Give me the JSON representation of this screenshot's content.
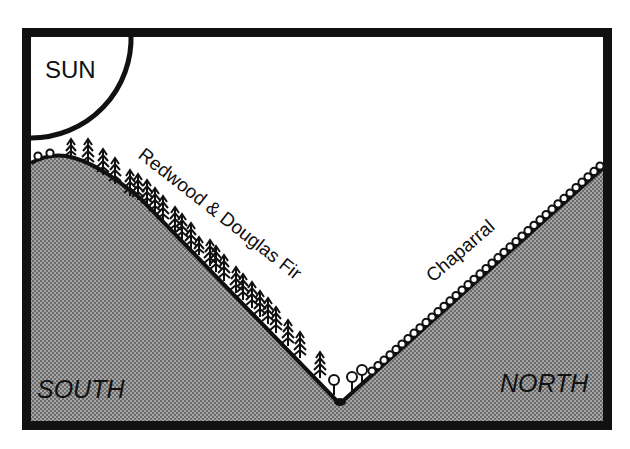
{
  "diagram": {
    "labels": {
      "sun": "SUN",
      "south_vegetation": "Redwood & Douglas Fir",
      "north_vegetation": "Chaparral",
      "south": "SOUTH",
      "north": "NORTH"
    },
    "colors": {
      "ink": "#111111",
      "background": "#ffffff",
      "ground_fill": "#9a9a9a",
      "ground_dot": "#6e6e6e"
    },
    "icons": {
      "tree": "conifer-tree-icon",
      "shrub": "shrub-icon",
      "sun": "sun-quarter-circle"
    }
  }
}
